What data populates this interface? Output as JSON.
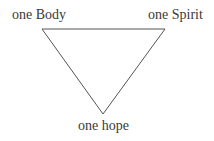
{
  "diagram": {
    "type": "triangle",
    "orientation": "inverted",
    "stroke_color": "#555555",
    "nodes": [
      {
        "id": "top-left",
        "label": "one Body",
        "x": 42,
        "y": 29
      },
      {
        "id": "top-right",
        "label": "one Spirit",
        "x": 165,
        "y": 29
      },
      {
        "id": "bottom",
        "label": "one hope",
        "x": 103,
        "y": 114
      }
    ],
    "edges": [
      [
        "top-left",
        "top-right"
      ],
      [
        "top-right",
        "bottom"
      ],
      [
        "bottom",
        "top-left"
      ]
    ]
  }
}
